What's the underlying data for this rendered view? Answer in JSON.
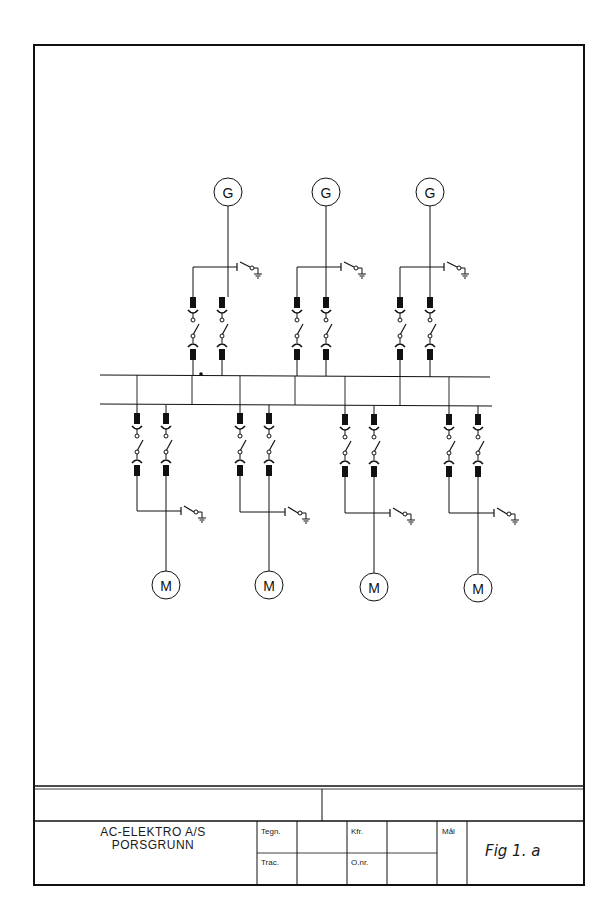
{
  "drawing": {
    "title_block": {
      "company_line1": "AC-ELEKTRO A/S",
      "company_line2": "PORSGRUNN",
      "fields": {
        "tegn_label": "Tegn.",
        "trac_label": "Trac.",
        "kfr_label": "Kfr.",
        "onr_label": "O.nr.",
        "mal_label": "Mål"
      },
      "figure_id": "Fig 1. a"
    },
    "diagram": {
      "type": "single-line electrical schematic",
      "busbars": 2,
      "generators": [
        {
          "label": "G",
          "feeders": 2
        },
        {
          "label": "G",
          "feeders": 2
        },
        {
          "label": "G",
          "feeders": 2
        }
      ],
      "motors": [
        {
          "label": "M",
          "feeders": 2
        },
        {
          "label": "M",
          "feeders": 2
        },
        {
          "label": "M",
          "feeders": 2
        },
        {
          "label": "M",
          "feeders": 2
        }
      ],
      "generator_symbol_label": "G",
      "motor_symbol_label": "M"
    }
  }
}
